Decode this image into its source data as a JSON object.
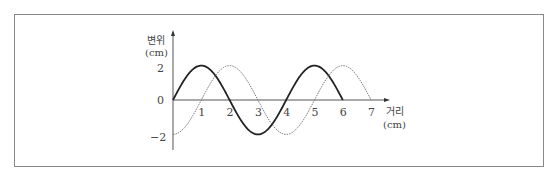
{
  "chart_data": {
    "type": "line",
    "title": "",
    "xlabel": "거리 (cm)",
    "ylabel": "변위 (cm)",
    "xlabel_lines": [
      "거리",
      "(cm)"
    ],
    "ylabel_lines": [
      "변위",
      "(cm)"
    ],
    "xlim": [
      0,
      7
    ],
    "ylim": [
      -2,
      2
    ],
    "x_ticks": [
      "1",
      "2",
      "3",
      "4",
      "5",
      "6",
      "7"
    ],
    "y_ticks": [
      "2",
      "0",
      "-2"
    ],
    "grid": false,
    "legend": null,
    "series": [
      {
        "name": "solid wave",
        "style": "solid",
        "x": [
          0,
          1,
          2,
          3,
          4,
          5,
          6
        ],
        "values": [
          0,
          2,
          0,
          -2,
          0,
          2,
          0
        ]
      },
      {
        "name": "dotted wave",
        "style": "dotted",
        "x": [
          0,
          1,
          2,
          3,
          4,
          5,
          6,
          7
        ],
        "values": [
          -2,
          0,
          2,
          0,
          -2,
          0,
          2,
          0
        ]
      }
    ]
  }
}
